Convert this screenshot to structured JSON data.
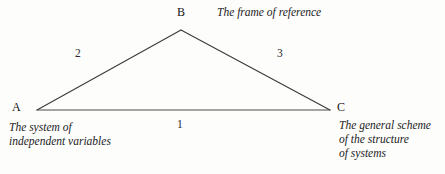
{
  "figure": {
    "type": "triangle-diagram",
    "background_color": "#fdfdfc",
    "stroke_color": "#3a3a3a",
    "text_color": "#1b1b1b",
    "vertices": [
      {
        "id": "A",
        "label": "A",
        "x": 37,
        "y": 110
      },
      {
        "id": "B",
        "label": "B",
        "x": 181,
        "y": 30
      },
      {
        "id": "C",
        "label": "C",
        "x": 330,
        "y": 110
      }
    ],
    "edges": [
      {
        "id": "1",
        "label": "1",
        "from": "A",
        "to": "C"
      },
      {
        "id": "2",
        "label": "2",
        "from": "A",
        "to": "B"
      },
      {
        "id": "3",
        "label": "3",
        "from": "B",
        "to": "C"
      }
    ],
    "captions": {
      "frame_of_reference": "The frame of reference",
      "system_of_independent_variables": "The system of\nindependent variables",
      "general_scheme_of_structure_of_systems": "The general scheme\nof the structure\nof systems"
    }
  }
}
